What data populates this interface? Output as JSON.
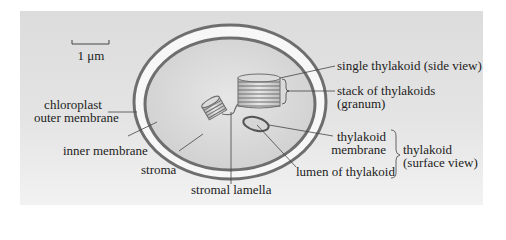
{
  "figure": {
    "colors": {
      "background_panel": "#e0e0e0",
      "membrane": "#6e6e6e",
      "intermembrane_space": "#f7f7f7",
      "stroma": "#d9d9d9",
      "leader_line": "#444444",
      "text": "#222222"
    },
    "scale_bar": {
      "label": "1 μm"
    },
    "labels": {
      "outer_membrane_line1": "chloroplast",
      "outer_membrane_line2": "outer membrane",
      "inner_membrane": "inner membrane",
      "stroma": "stroma",
      "stromal_lamella": "stromal lamella",
      "single_thylakoid": "single thylakoid (side view)",
      "granum_line1": "stack of thylakoids",
      "granum_line2": "(granum)",
      "thylakoid_membrane_line1": "thylakoid",
      "thylakoid_membrane_line2": "membrane",
      "lumen": "lumen of thylakoid",
      "surface_view_line1": "thylakoid",
      "surface_view_line2": "(surface view)"
    }
  }
}
